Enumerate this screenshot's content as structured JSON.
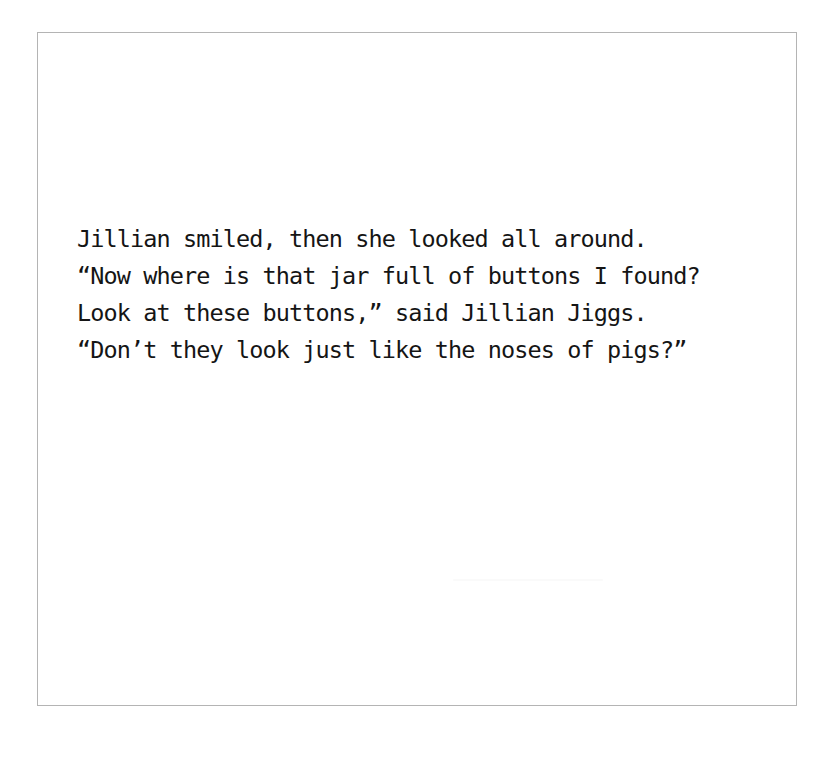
{
  "page": {
    "background_color": "#ffffff",
    "sheet_border_color": "#b4b4b4",
    "text_color": "#151515",
    "artifact_color": "#fafafa"
  },
  "verse": {
    "lines": [
      "Jillian smiled, then she looked all around.",
      "“Now where is that jar full of buttons I found?",
      "Look at these buttons,” said Jillian Jiggs.",
      "“Don’t they look just like the noses of pigs?”"
    ]
  }
}
